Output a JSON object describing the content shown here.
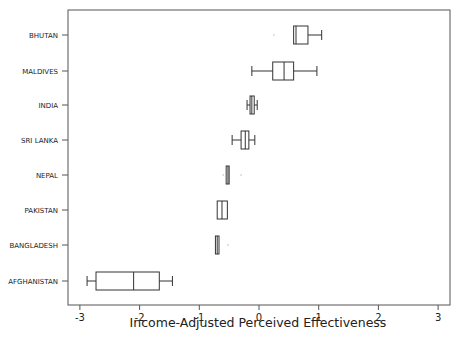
{
  "chart_data": {
    "type": "boxplot",
    "orientation": "horizontal",
    "title": "",
    "xlabel": "Income-Adjusted Perceived Effectiveness",
    "ylabel": "",
    "xlim": [
      -3.2,
      3.2
    ],
    "xticks": [
      -3,
      -2,
      -1,
      0,
      1,
      2,
      3
    ],
    "xtick_labels": [
      "-3",
      "-2",
      "-1",
      "0",
      "1",
      "2",
      "3"
    ],
    "grid": false,
    "legend": null,
    "categories": [
      "BHUTAN",
      "MALDIVES",
      "INDIA",
      "SRI LANKA",
      "NEPAL",
      "PAKISTAN",
      "BANGLADESH",
      "AFGHANISTAN"
    ],
    "series": [
      {
        "name": "BHUTAN",
        "min": 0.58,
        "q1": 0.58,
        "median": 0.62,
        "q3": 0.82,
        "max": 1.05,
        "outliers": [
          0.25
        ]
      },
      {
        "name": "MALDIVES",
        "min": -0.12,
        "q1": 0.23,
        "median": 0.42,
        "q3": 0.58,
        "max": 0.97,
        "outliers": []
      },
      {
        "name": "INDIA",
        "min": -0.2,
        "q1": -0.15,
        "median": -0.12,
        "q3": -0.08,
        "max": -0.03,
        "outliers": []
      },
      {
        "name": "SRI LANKA",
        "min": -0.45,
        "q1": -0.3,
        "median": -0.23,
        "q3": -0.17,
        "max": -0.07,
        "outliers": []
      },
      {
        "name": "NEPAL",
        "min": -0.55,
        "q1": -0.55,
        "median": -0.52,
        "q3": -0.5,
        "max": -0.5,
        "outliers": [
          -0.6,
          -0.3
        ]
      },
      {
        "name": "PAKISTAN",
        "min": -0.7,
        "q1": -0.7,
        "median": -0.62,
        "q3": -0.53,
        "max": -0.53,
        "outliers": []
      },
      {
        "name": "BANGLADESH",
        "min": -0.73,
        "q1": -0.73,
        "median": -0.7,
        "q3": -0.67,
        "max": -0.67,
        "outliers": [
          -0.52
        ]
      },
      {
        "name": "AFGHANISTAN",
        "min": -2.88,
        "q1": -2.73,
        "median": -2.1,
        "q3": -1.67,
        "max": -1.45,
        "outliers": []
      }
    ]
  },
  "colors": {
    "stroke": "#333333",
    "background": "#ffffff"
  }
}
